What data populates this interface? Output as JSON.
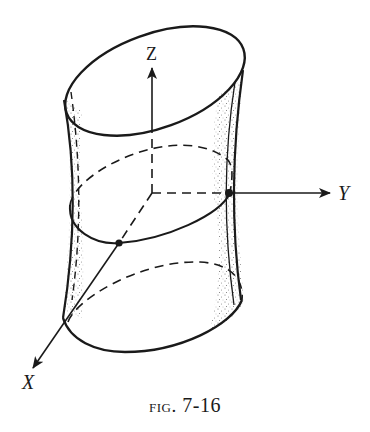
{
  "figure": {
    "caption_prefix": "fig.",
    "caption_number": "7-16"
  },
  "axes": {
    "x_label": "X",
    "y_label": "Y",
    "z_label": "Z"
  },
  "colors": {
    "ink": "#1a1a1a",
    "background": "#ffffff",
    "stipple": "#555555"
  }
}
